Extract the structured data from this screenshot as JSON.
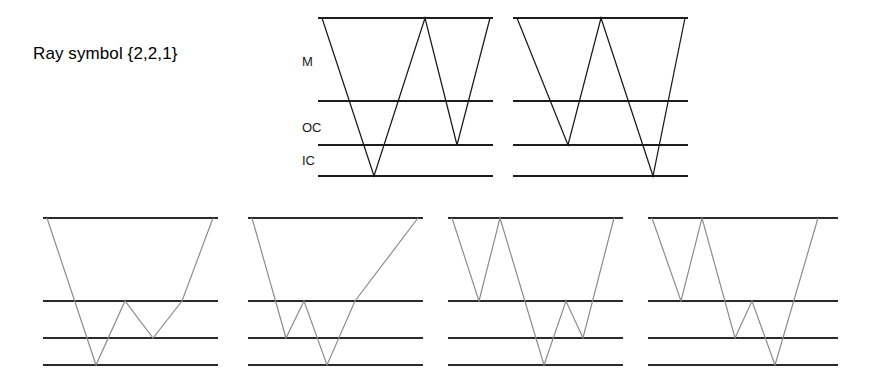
{
  "figure": {
    "caption": "Ray symbol {2,2,1}",
    "width": 870,
    "height": 387,
    "background": "#ffffff",
    "dark_stroke": "#1a1a1a",
    "gray_stroke": "#8c8c8c",
    "level_stroke": "#1c1c1c"
  },
  "level_labels": {
    "mantle": "M",
    "outer_core": "OC",
    "inner_core": "IC"
  },
  "top_row": {
    "level_y": {
      "surface": 18,
      "mantle_base": 101,
      "outer_core_base": 145,
      "inner_core_base": 176
    },
    "label_x": 302,
    "label_y": {
      "mantle": 66,
      "outer_core": 132,
      "inner_core": 165
    },
    "diagrams": [
      {
        "name": "top-diagram-1",
        "x_start": 318,
        "x_end": 493,
        "ray_points": "322,18 374,176 425,18 457,145 490,18",
        "description": "Ray enters at left, descends to inner core boundary, rises to surface, descends to outer core boundary, rises to surface"
      },
      {
        "name": "top-diagram-2",
        "x_start": 513,
        "x_end": 688,
        "ray_points": "517,18 568,145 601,18 653,176 685,18",
        "description": "Mirror: descends to outer core boundary, rises to surface, descends to inner core boundary, rises to surface"
      }
    ]
  },
  "bottom_row": {
    "level_y": {
      "surface": 218,
      "mantle_base": 301,
      "outer_core_base": 338,
      "inner_core_base": 365
    },
    "diagrams": [
      {
        "name": "bottom-diagram-1",
        "x_start": 43,
        "x_end": 218,
        "ray_points": "47,218 96,365 125,301 153,338 182,301 213,218",
        "description": "Long descent to inner core, small W bounce between mantle base and outer core base, rise to surface"
      },
      {
        "name": "bottom-diagram-2",
        "x_start": 248,
        "x_end": 423,
        "ray_points": "252,218 286,338 304,301 327,365 355,301 418,218",
        "description": "Descent to outer core base, small V, descent to inner core base, rise to surface"
      },
      {
        "name": "bottom-diagram-3",
        "x_start": 448,
        "x_end": 623,
        "ray_points": "452,218 479,301 500,218 544,365 566,301 583,338 614,218",
        "description": "Mirror of diagram 2: short V to mantle base, long V to inner core, small V to outer core base"
      },
      {
        "name": "bottom-diagram-4",
        "x_start": 648,
        "x_end": 838,
        "ray_points": "652,218 681,301 702,218 735,338 752,301 775,365 818,218",
        "description": "Mirror of diagram 1: short V, small W, long descent to inner core, rise to surface"
      }
    ]
  }
}
